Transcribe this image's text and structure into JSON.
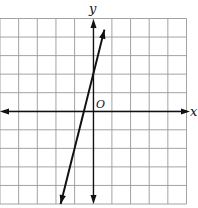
{
  "chart_data": {
    "type": "line",
    "title": "",
    "xlabel": "x",
    "ylabel": "y",
    "origin_label": "O",
    "grid": true,
    "xlim": [
      -5,
      5
    ],
    "ylim": [
      -5,
      5
    ],
    "series": [
      {
        "name": "line",
        "equation": "y = 4x + 2",
        "slope": 4,
        "intercept": 2,
        "x": [
          -1.75,
          0.6
        ],
        "y": [
          -5,
          4.4
        ]
      }
    ]
  },
  "labels": {
    "x": "x",
    "y": "y",
    "origin": "O"
  },
  "colors": {
    "grid": "#999999",
    "axis": "#111111",
    "line": "#111111"
  }
}
